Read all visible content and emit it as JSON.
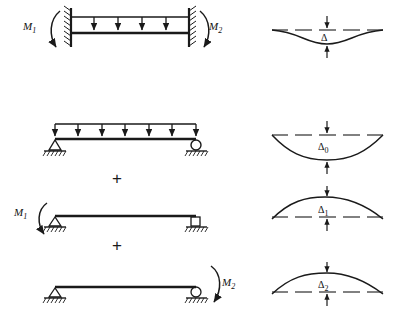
{
  "figure": {
    "stroke_color": "#1a1a1a",
    "background": "#ffffff"
  },
  "rows": [
    {
      "id": "row-fixed-fixed",
      "left_moment_label": "M",
      "left_moment_sub": "1",
      "right_moment_label": "M",
      "right_moment_sub": "2",
      "support_left": "fixed-wall",
      "support_right": "fixed-wall",
      "load": "uniform-distributed",
      "load_arrow_count": 4,
      "deflection_label": "Δ",
      "deflection_sub": "",
      "deflection_direction": "down"
    },
    {
      "id": "row-simply-supported-load",
      "left_moment_label": "",
      "left_moment_sub": "",
      "right_moment_label": "",
      "right_moment_sub": "",
      "support_left": "pin-triangle",
      "support_right": "roller-circle",
      "load": "uniform-distributed",
      "load_arrow_count": 5,
      "deflection_label": "Δ",
      "deflection_sub": "0",
      "deflection_direction": "down"
    },
    {
      "id": "row-moment-m1",
      "left_moment_label": "M",
      "left_moment_sub": "1",
      "right_moment_label": "",
      "right_moment_sub": "",
      "support_left": "pin-triangle",
      "support_right": "roller-square",
      "load": "none",
      "load_arrow_count": 0,
      "deflection_label": "Δ",
      "deflection_sub": "1",
      "deflection_direction": "up"
    },
    {
      "id": "row-moment-m2",
      "left_moment_label": "",
      "left_moment_sub": "",
      "right_moment_label": "M",
      "right_moment_sub": "2",
      "support_left": "pin-triangle",
      "support_right": "roller-circle",
      "load": "none",
      "load_arrow_count": 0,
      "deflection_label": "Δ",
      "deflection_sub": "2",
      "deflection_direction": "up"
    }
  ],
  "operators": [
    {
      "id": "plus-1",
      "symbol": "+"
    },
    {
      "id": "plus-2",
      "symbol": "+"
    }
  ]
}
